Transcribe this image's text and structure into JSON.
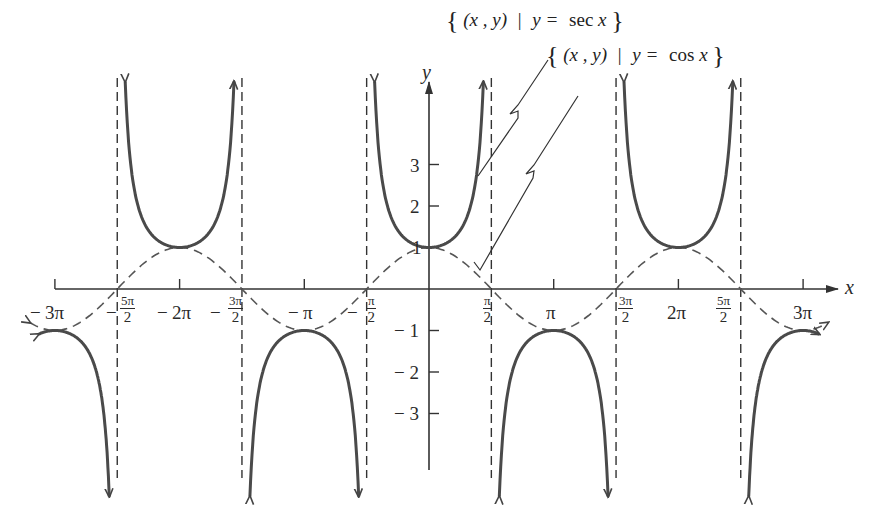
{
  "chart_data": {
    "type": "line",
    "title": "",
    "xlabel": "x",
    "ylabel": "y",
    "xlim": [
      -9.9,
      10.1
    ],
    "ylim": [
      -4.4,
      5.6
    ],
    "grid": false,
    "legend": "annotations with leader lines, top center-right",
    "x_ticks": [
      {
        "value": "-3π",
        "label": "− 3π"
      },
      {
        "value": "-5π/2",
        "label": "− 5π/2"
      },
      {
        "value": "-2π",
        "label": "− 2π"
      },
      {
        "value": "-3π/2",
        "label": "− 3π/2"
      },
      {
        "value": "-π",
        "label": "− π"
      },
      {
        "value": "-π/2",
        "label": "− π/2"
      },
      {
        "value": "π/2",
        "label": "π/2"
      },
      {
        "value": "π",
        "label": "π"
      },
      {
        "value": "3π/2",
        "label": "3π/2"
      },
      {
        "value": "2π",
        "label": "2π"
      },
      {
        "value": "5π/2",
        "label": "5π/2"
      },
      {
        "value": "3π",
        "label": "3π"
      }
    ],
    "y_ticks": [
      3,
      2,
      1,
      -1,
      -2,
      -3
    ],
    "vertical_asymptotes": [
      "-5π/2",
      "-3π/2",
      "-π/2",
      "π/2",
      "3π/2",
      "5π/2"
    ],
    "series": [
      {
        "name": "{(x, y) | y = sec x}",
        "function": "sec x",
        "style": "solid, thick, arrowheads at asymptotes",
        "key_points": [
          [
            -9.42,
            -1
          ],
          [
            -6.28,
            1
          ],
          [
            -3.14,
            -1
          ],
          [
            0,
            1
          ],
          [
            3.14,
            -1
          ],
          [
            6.28,
            1
          ],
          [
            9.42,
            -1
          ]
        ]
      },
      {
        "name": "{(x, y) | y = cos x}",
        "function": "cos x",
        "style": "dashed, arrowheads at both ends",
        "key_points": [
          [
            -9.42,
            -1
          ],
          [
            -7.85,
            0
          ],
          [
            -6.28,
            1
          ],
          [
            -4.71,
            0
          ],
          [
            -3.14,
            -1
          ],
          [
            -1.57,
            0
          ],
          [
            0,
            1
          ],
          [
            1.57,
            0
          ],
          [
            3.14,
            -1
          ],
          [
            4.71,
            0
          ],
          [
            6.28,
            1
          ],
          [
            7.85,
            0
          ],
          [
            9.42,
            -1
          ]
        ]
      }
    ],
    "annotations": [
      {
        "text": "{ (x , y) | y = sec x }",
        "points_to": "sec x curve near x≈1.2, y≈2.8"
      },
      {
        "text": "{ (x , y) | y = cos x }",
        "points_to": "cos x curve near x≈1.2, y≈0.4"
      }
    ]
  },
  "axes": {
    "x_label": "x",
    "y_label": "y",
    "x_ticks": {
      "neg3pi": "3π",
      "neg2pi": "2π",
      "negpi": "π",
      "pi": "π",
      "twopi": "2π",
      "threepi": "3π",
      "minus": "−",
      "pi_sym": "π",
      "two": "2",
      "five_pi": "5π",
      "three_pi": "3π"
    },
    "y_ticks": {
      "p3": "3",
      "p2": "2",
      "p1": "1",
      "m1": "− 1",
      "m2": "− 2",
      "m3": "− 3"
    }
  },
  "annotations": {
    "sec": {
      "lbrace": "{",
      "rbrace": "}",
      "pair": "(x , y)",
      "bar": "|",
      "eq": "y = ",
      "fn": "sec",
      "var": "x"
    },
    "cos": {
      "lbrace": "{",
      "rbrace": "}",
      "pair": "(x , y)",
      "bar": "|",
      "eq": "y = ",
      "fn": "cos",
      "var": "x"
    }
  },
  "colors": {
    "curve": "#4a4a4a",
    "axis": "#333333",
    "text": "#2a2a2a",
    "background": "#ffffff"
  }
}
